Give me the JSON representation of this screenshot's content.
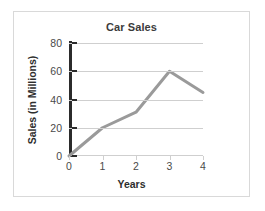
{
  "card": {
    "border_color": "#d9d9d9",
    "background": "#ffffff"
  },
  "chart_data": {
    "type": "line",
    "title": "Car Sales",
    "xlabel": "Years",
    "ylabel": "Sales (in Millions)",
    "x": [
      0,
      1,
      2,
      3,
      4
    ],
    "values": [
      0,
      20,
      31,
      60,
      45
    ],
    "series": [
      {
        "name": "Car Sales",
        "values": [
          0,
          20,
          31,
          60,
          45
        ]
      }
    ],
    "xtick_labels": [
      "0",
      "1",
      "2",
      "3",
      "4"
    ],
    "ytick_labels": [
      "0",
      "20",
      "40",
      "60",
      "80"
    ],
    "ytick_values": [
      0,
      20,
      40,
      60,
      80
    ],
    "xlim": [
      0,
      4
    ],
    "ylim": [
      0,
      80
    ],
    "grid": "horizontal",
    "legend": "none",
    "line_color": "#9a9a9a",
    "line_width": 3,
    "markers": "none",
    "gridline_color": "#cfcfcf",
    "y_axis_color": "#2b2b2b",
    "x_axis_color": "#cfcfcf",
    "title_color": "#3b3b3b",
    "tick_label_color": "#4a4a4a"
  }
}
